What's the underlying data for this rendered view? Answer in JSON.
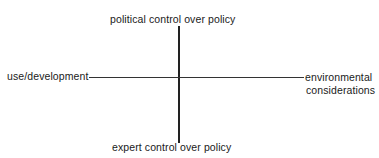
{
  "diagram": {
    "type": "quadrant-axes",
    "vertical_axis": {
      "top_label": "political control over policy",
      "bottom_label": "expert control over policy"
    },
    "horizontal_axis": {
      "left_label": "use/development",
      "right_label_line1": "environmental",
      "right_label_line2": "considerations"
    },
    "colors": {
      "line": "#222222",
      "text": "#1a1a1a",
      "background": "#ffffff"
    }
  }
}
